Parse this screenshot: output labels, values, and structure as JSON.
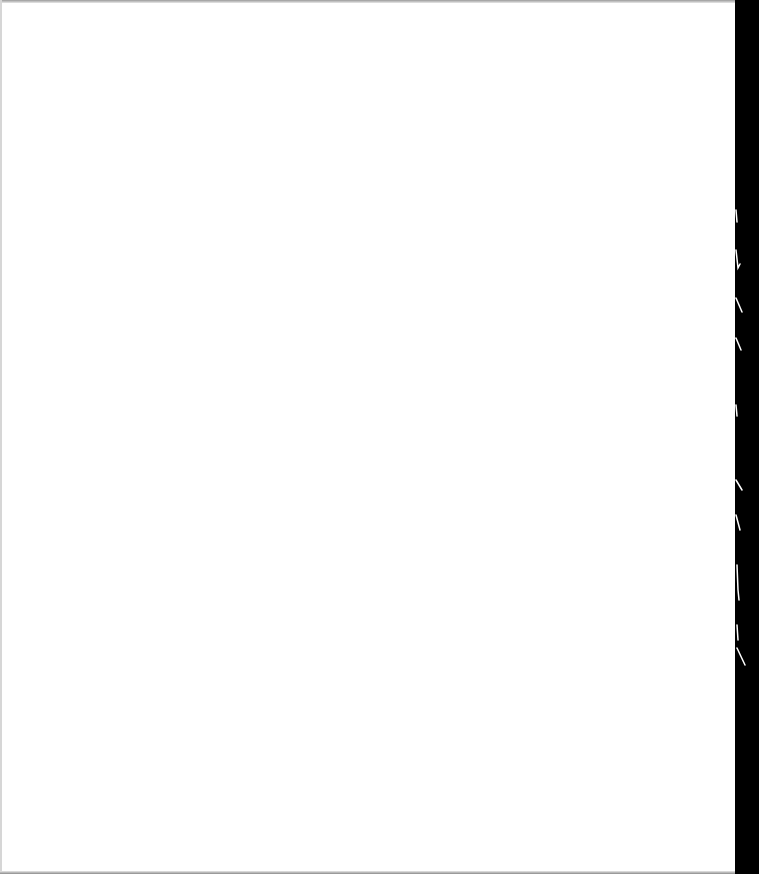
{
  "document": {
    "type": "scanned-page",
    "content_state": "blank",
    "text": ""
  },
  "colors": {
    "paper": "#ffffff",
    "binding_edge": "#000000",
    "scan_border": "#9a9a9a"
  }
}
